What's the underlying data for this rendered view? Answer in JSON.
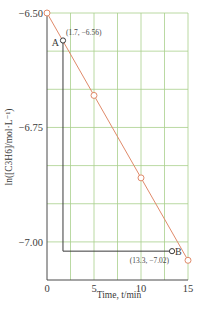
{
  "chart_data": {
    "type": "line",
    "title": "",
    "xlabel": "Time, t/min",
    "ylabel": "ln([C3H6]/mol·L⁻¹)",
    "xlim": [
      0,
      15
    ],
    "ylim": [
      -7.083,
      -6.5
    ],
    "x_ticks": [
      0,
      5,
      10,
      15
    ],
    "x_tick_labels": [
      "0",
      "5",
      "10",
      "15"
    ],
    "y_ticks": [
      -6.5,
      -6.75,
      -7.0
    ],
    "y_tick_labels": [
      "−6.50",
      "−6.75",
      "−7.00"
    ],
    "grid": true,
    "x_grid_step": 2.5,
    "y_grid_step": 0.0833,
    "series": [
      {
        "name": "ln[C3H6] vs time",
        "color": "#e08a6a",
        "x": [
          0,
          5,
          10,
          15
        ],
        "y": [
          -6.5,
          -6.68,
          -6.86,
          -7.04
        ],
        "markers": "open-circle"
      }
    ],
    "annotations": [
      {
        "label": "A",
        "x": 1.7,
        "y": -6.56,
        "text": "(1.7, −6.56)"
      },
      {
        "label": "B",
        "x": 13.3,
        "y": -7.02,
        "text": "(13.3, −7.02)"
      }
    ],
    "colors": {
      "grid": "#a8cf8c",
      "line": "#e08a6a",
      "axis": "#4a4a4a"
    }
  }
}
